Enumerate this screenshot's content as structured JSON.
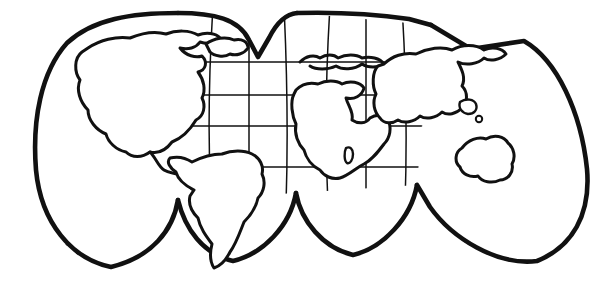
{
  "figure": {
    "title": "World Map — Interrupted Projection (Outline)",
    "kind": "line-art-map",
    "background_color": "#ffffff",
    "ink_color": "#111111",
    "width_px": 610,
    "height_px": 284
  },
  "projection": {
    "name": "Interrupted pseudocylindrical (Goode homolosine style)",
    "lobe_count": 4,
    "interruption_style": "northern V-notch and southern cusps",
    "graticule_visible": true,
    "graticule_color": "#111111",
    "latitude_lines_y": [
      62,
      95,
      126,
      167,
      207,
      245
    ],
    "southern_cusps_x": [
      178,
      296,
      417
    ],
    "northern_notch_x": 249
  },
  "lobes": [
    {
      "id": "lobe-1",
      "label": "Western lobe — North America",
      "x_range": [
        33,
        178
      ],
      "meridians_x": [
        70,
        106,
        142
      ]
    },
    {
      "id": "lobe-2",
      "label": "Second lobe — South America",
      "x_range": [
        178,
        296
      ],
      "meridians_x": [
        213,
        249,
        268
      ]
    },
    {
      "id": "lobe-3",
      "label": "Third lobe — Europe / Africa",
      "x_range": [
        296,
        417
      ],
      "meridians_x": [
        330,
        368,
        400
      ]
    },
    {
      "id": "lobe-4",
      "label": "Eastern lobe — Asia / Australia",
      "x_range": [
        417,
        590
      ],
      "meridians_x": [
        455,
        495,
        530
      ]
    }
  ],
  "landmasses": [
    {
      "id": "north-america",
      "label": "North America",
      "lobe": "lobe-1"
    },
    {
      "id": "greenland",
      "label": "Greenland",
      "lobe": "lobe-1"
    },
    {
      "id": "central-america",
      "label": "Central America",
      "lobe": "lobe-1"
    },
    {
      "id": "south-america",
      "label": "South America",
      "lobe": "lobe-2"
    },
    {
      "id": "europe",
      "label": "Europe",
      "lobe": "lobe-3"
    },
    {
      "id": "africa",
      "label": "Africa",
      "lobe": "lobe-3"
    },
    {
      "id": "madagascar",
      "label": "Madagascar",
      "lobe": "lobe-3"
    },
    {
      "id": "asia",
      "label": "Asia",
      "lobe": "lobe-4"
    },
    {
      "id": "australia",
      "label": "Australia",
      "lobe": "lobe-4"
    },
    {
      "id": "new-guinea",
      "label": "New Guinea",
      "lobe": "lobe-4"
    },
    {
      "id": "island-small",
      "label": "Small island",
      "lobe": "lobe-4"
    }
  ]
}
